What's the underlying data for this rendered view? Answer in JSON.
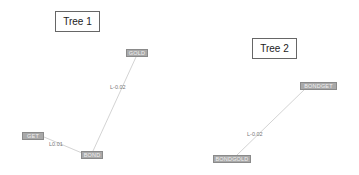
{
  "trees": [
    {
      "title": "Tree 1",
      "nodes": [
        {
          "id": "gold",
          "label": "GOLD"
        },
        {
          "id": "get",
          "label": "GET"
        },
        {
          "id": "bond",
          "label": "BOND"
        }
      ],
      "edges": [
        {
          "from": "bond",
          "to": "gold",
          "label": "L-0.02"
        },
        {
          "from": "get",
          "to": "bond",
          "label": "L0.01"
        }
      ]
    },
    {
      "title": "Tree 2",
      "nodes": [
        {
          "id": "bondget",
          "label": "BONDGET"
        },
        {
          "id": "bondgold",
          "label": "BONDGOLD"
        }
      ],
      "edges": [
        {
          "from": "bondgold",
          "to": "bondget",
          "label": "L-0.02"
        }
      ]
    }
  ],
  "colors": {
    "node_fill": "#a9a9a9",
    "edge": "#c8c8c8",
    "text": "#222222"
  }
}
